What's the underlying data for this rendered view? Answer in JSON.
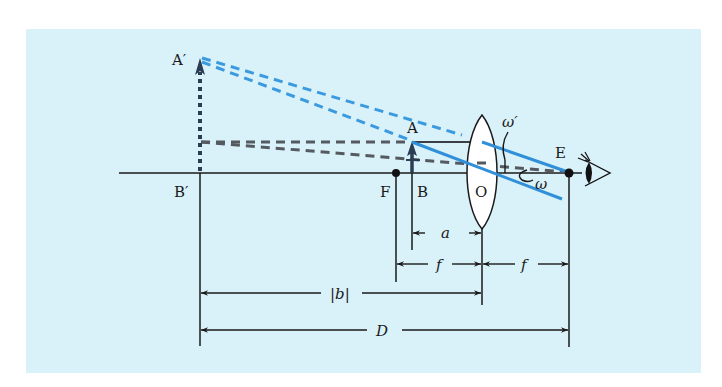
{
  "figure": {
    "background": "#d9f1f9",
    "colors": {
      "line": "#1a1a1a",
      "blue_ray": "#2f8fd8",
      "blue_dashed": "#3a9ae0",
      "gray_dashed": "#555a60",
      "object_arrow": "#2a3d52",
      "lens_fill": "#ffffff"
    }
  },
  "points": {
    "image_top": {
      "label": "A′"
    },
    "image_base": {
      "label": "B′"
    },
    "object_top": {
      "label": "A"
    },
    "object_base": {
      "label": "B"
    },
    "focal_point": {
      "label": "F"
    },
    "lens_center": {
      "label": "O"
    },
    "eye_point": {
      "label": "E"
    }
  },
  "angles": {
    "image_angle": {
      "label": "ω′"
    },
    "object_angle": {
      "label": "ω"
    }
  },
  "dimensions": {
    "a": {
      "label": "a"
    },
    "f_left": {
      "label": "f"
    },
    "f_right": {
      "label": "f"
    },
    "b": {
      "label": "|b|"
    },
    "D": {
      "label": "D"
    }
  }
}
